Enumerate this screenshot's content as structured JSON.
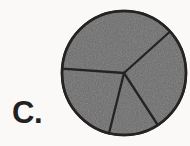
{
  "figure": {
    "label": "C.",
    "caption_position": "bottom-left",
    "background_color": "#faf9f7",
    "ink_color": "#23211f"
  },
  "chart_data": {
    "type": "pie",
    "title": "C.",
    "xlabel": "",
    "ylabel": "",
    "legend": "none",
    "grid": false,
    "labels_shown": false,
    "center_x": 124,
    "center_y": 73,
    "radius": 62,
    "fill_color": "#6b6b6b",
    "stroke_color": "#262422",
    "stroke_width": 2.5,
    "slice_count": 4,
    "categories": [
      "Slice 1",
      "Slice 2",
      "Slice 3",
      "Slice 4"
    ],
    "values": [
      37,
      22,
      13,
      28
    ],
    "start_angle_deg": -42,
    "boundary_angles_deg": [
      -42,
      184,
      104,
      57
    ],
    "slices": [
      {
        "name": "Slice 1",
        "start_deg": -42,
        "end_deg": 184,
        "sweep_deg": 226,
        "fraction": 0.628,
        "value": 37
      },
      {
        "name": "Slice 2",
        "start_deg": 184,
        "end_deg": 104,
        "sweep_deg": 280,
        "fraction": 0.222,
        "value": 22
      },
      {
        "name": "Slice 3",
        "start_deg": 104,
        "end_deg": 57,
        "sweep_deg": 313,
        "fraction": 0.131,
        "value": 13
      },
      {
        "name": "Slice 4",
        "start_deg": 57,
        "end_deg": -42,
        "sweep_deg": 261,
        "fraction": 0.275,
        "value": 28
      }
    ]
  }
}
